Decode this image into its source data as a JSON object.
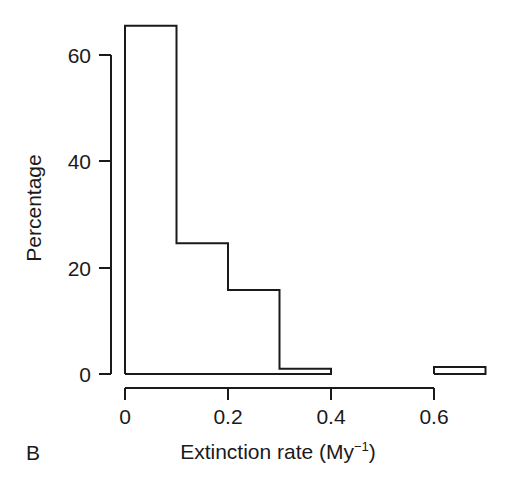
{
  "figure": {
    "panel_label": "B",
    "background_color": "#ffffff",
    "line_color": "#1a1a1a"
  },
  "chart_data": {
    "type": "bar",
    "title": "",
    "subtitle": "",
    "xlabel": "Extinction rate (My",
    "xlabel_exponent": "−1",
    "xlabel_suffix": ")",
    "xlabel_full": "Extinction rate (My⁻¹)",
    "ylabel": "Percentage",
    "xlim": [
      0,
      0.7
    ],
    "ylim": [
      0,
      68
    ],
    "grid": false,
    "legend": "none",
    "bin_width": 0.1,
    "categories": [
      "0–0.1",
      "0.1–0.2",
      "0.2–0.3",
      "0.3–0.4",
      "0.4–0.5",
      "0.5–0.6",
      "0.6–0.7"
    ],
    "bin_edges": [
      0,
      0.1,
      0.2,
      0.3,
      0.4,
      0.5,
      0.6,
      0.7
    ],
    "values": [
      65.5,
      24.6,
      15.8,
      1.0,
      0,
      0,
      1.3
    ],
    "x_ticks": [
      0,
      0.2,
      0.4,
      0.6
    ],
    "x_tick_labels": [
      "0",
      "0.2",
      "0.4",
      "0.6"
    ],
    "y_ticks": [
      0,
      20,
      40,
      60
    ],
    "y_tick_labels": [
      "0",
      "20",
      "40",
      "60"
    ]
  }
}
